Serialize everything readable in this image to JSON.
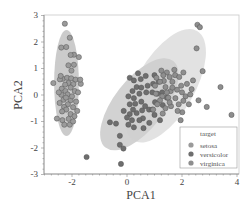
{
  "chart_data": {
    "type": "scatter",
    "title": "",
    "xlabel": "PCA1",
    "ylabel": "PCA2",
    "xlim": [
      -3.05,
      4.05
    ],
    "ylim": [
      -3,
      3
    ],
    "xticks": [
      -2,
      0,
      2,
      4
    ],
    "yticks": [
      -3,
      -2,
      -1,
      0,
      1,
      2,
      3
    ],
    "grid": false,
    "legend": {
      "title": "target",
      "position": "lower right",
      "entries": [
        "setosa",
        "versicolor",
        "virginica"
      ]
    },
    "ellipses": [
      {
        "name": "setosa",
        "cx": -2.2,
        "cy": 0.45,
        "rx": 0.45,
        "ry": 2.0,
        "angle_deg": 0,
        "fill": "#a8a8a8"
      },
      {
        "name": "versicolor",
        "cx": 0.45,
        "cy": -0.35,
        "rx": 2.0,
        "ry": 0.95,
        "angle_deg": 52,
        "fill": "#b4b4b4"
      },
      {
        "name": "virginica",
        "cx": 1.4,
        "cy": 0.35,
        "rx": 2.3,
        "ry": 1.1,
        "angle_deg": 60,
        "fill": "#cfcfcf"
      }
    ],
    "series": [
      {
        "name": "setosa",
        "color": "#9a9a9a",
        "points": [
          [
            -2.26,
            2.69
          ],
          [
            -2.39,
            1.79
          ],
          [
            -2.08,
            2.16
          ],
          [
            -2.21,
            1.81
          ],
          [
            -1.93,
            1.52
          ],
          [
            -2.05,
            1.51
          ],
          [
            -1.75,
            1.43
          ],
          [
            -1.93,
            1.14
          ],
          [
            -2.13,
            1.12
          ],
          [
            -2.02,
            0.92
          ],
          [
            -2.68,
            0.45
          ],
          [
            -2.33,
            0.61
          ],
          [
            -2.18,
            0.65
          ],
          [
            -2.44,
            0.59
          ],
          [
            -2.03,
            0.63
          ],
          [
            -1.87,
            0.58
          ],
          [
            -2.13,
            0.45
          ],
          [
            -2.25,
            0.39
          ],
          [
            -1.95,
            0.41
          ],
          [
            -1.68,
            0.42
          ],
          [
            -2.37,
            0.24
          ],
          [
            -2.05,
            0.28
          ],
          [
            -2.24,
            0.15
          ],
          [
            -1.9,
            0.15
          ],
          [
            -2.16,
            0.02
          ],
          [
            -2.39,
            0.01
          ],
          [
            -1.78,
            0.1
          ],
          [
            -2.31,
            -0.18
          ],
          [
            -2.05,
            -0.2
          ],
          [
            -1.85,
            -0.25
          ],
          [
            -2.15,
            -0.35
          ],
          [
            -2.45,
            -0.3
          ],
          [
            -2.29,
            -0.45
          ],
          [
            -1.96,
            -0.46
          ],
          [
            -2.21,
            -0.55
          ],
          [
            -1.81,
            -0.6
          ],
          [
            -2.36,
            -0.62
          ],
          [
            -2.05,
            -0.72
          ],
          [
            -1.91,
            -0.8
          ],
          [
            -2.12,
            -0.9
          ],
          [
            -2.35,
            -0.95
          ],
          [
            -2.55,
            -0.89
          ],
          [
            -2.28,
            -1.12
          ],
          [
            -2.08,
            -1.12
          ],
          [
            -1.96,
            -1.0
          ],
          [
            -2.22,
            -0.1
          ],
          [
            -2.0,
            -0.05
          ],
          [
            -2.48,
            0.1
          ],
          [
            -1.7,
            0.58
          ],
          [
            -2.41,
            0.72
          ]
        ]
      },
      {
        "name": "versicolor",
        "color": "#6e6e6e",
        "points": [
          [
            -1.47,
            -2.34
          ],
          [
            -0.62,
            -1.03
          ],
          [
            -0.26,
            -1.54
          ],
          [
            -0.26,
            -1.88
          ],
          [
            -0.13,
            -2.02
          ],
          [
            -0.22,
            -2.6
          ],
          [
            0.05,
            -1.12
          ],
          [
            0.25,
            -1.22
          ],
          [
            0.18,
            -0.95
          ],
          [
            -0.4,
            -1.08
          ],
          [
            0.1,
            -0.72
          ],
          [
            0.35,
            -0.68
          ],
          [
            0.58,
            -0.88
          ],
          [
            0.55,
            -0.58
          ],
          [
            0.8,
            -0.55
          ],
          [
            0.1,
            -0.35
          ],
          [
            0.3,
            -0.33
          ],
          [
            0.52,
            -0.25
          ],
          [
            0.05,
            -0.05
          ],
          [
            0.25,
            -0.12
          ],
          [
            0.45,
            0.05
          ],
          [
            0.7,
            0.1
          ],
          [
            0.92,
            0.1
          ],
          [
            1.1,
            0.05
          ],
          [
            1.28,
            0.1
          ],
          [
            0.2,
            0.15
          ],
          [
            0.35,
            0.3
          ],
          [
            0.52,
            0.28
          ],
          [
            0.75,
            0.35
          ],
          [
            0.95,
            0.42
          ],
          [
            1.15,
            0.5
          ],
          [
            0.25,
            0.55
          ],
          [
            0.5,
            0.6
          ],
          [
            0.68,
            0.72
          ],
          [
            0.4,
            0.82
          ],
          [
            0.1,
            0.65
          ],
          [
            1.0,
            0.75
          ],
          [
            0.22,
            -0.55
          ],
          [
            0.66,
            -0.42
          ],
          [
            1.02,
            -0.27
          ],
          [
            1.3,
            -0.38
          ],
          [
            1.0,
            -0.75
          ],
          [
            0.81,
            -1.05
          ],
          [
            1.2,
            -0.95
          ],
          [
            0.6,
            -1.25
          ],
          [
            0.0,
            -0.85
          ],
          [
            -0.12,
            -0.6
          ],
          [
            0.45,
            -0.95
          ],
          [
            0.92,
            -0.55
          ],
          [
            1.45,
            -0.1
          ]
        ]
      },
      {
        "name": "virginica",
        "color": "#8e8e8e",
        "points": [
          [
            2.56,
            2.65
          ],
          [
            2.65,
            2.56
          ],
          [
            2.53,
            1.76
          ],
          [
            1.07,
            0.65
          ],
          [
            1.34,
            0.53
          ],
          [
            1.55,
            0.68
          ],
          [
            1.75,
            0.75
          ],
          [
            1.9,
            0.68
          ],
          [
            1.65,
            0.5
          ],
          [
            1.4,
            0.3
          ],
          [
            1.59,
            0.15
          ],
          [
            1.82,
            0.2
          ],
          [
            2.0,
            0.1
          ],
          [
            1.28,
            -0.05
          ],
          [
            1.5,
            -0.1
          ],
          [
            1.76,
            -0.12
          ],
          [
            2.13,
            -0.05
          ],
          [
            2.25,
            -0.35
          ],
          [
            2.01,
            -0.65
          ],
          [
            1.84,
            -0.6
          ],
          [
            3.4,
            0.3
          ],
          [
            2.6,
            -0.2
          ],
          [
            2.9,
            -0.45
          ],
          [
            3.8,
            -0.75
          ],
          [
            1.2,
            -0.2
          ],
          [
            1.02,
            0.35
          ],
          [
            1.05,
            0.05
          ],
          [
            1.4,
            -0.5
          ],
          [
            1.6,
            -0.42
          ],
          [
            1.88,
            -0.35
          ],
          [
            2.18,
            0.42
          ],
          [
            2.4,
            0.55
          ],
          [
            1.3,
            -0.7
          ],
          [
            1.1,
            -0.35
          ],
          [
            1.45,
            0.85
          ],
          [
            1.72,
            0.95
          ],
          [
            2.05,
            0.85
          ],
          [
            2.35,
            0.22
          ],
          [
            2.05,
            -0.22
          ],
          [
            1.32,
            0.75
          ],
          [
            1.55,
            -0.28
          ],
          [
            1.97,
            0.35
          ],
          [
            2.3,
            0.02
          ],
          [
            1.65,
            0.28
          ],
          [
            1.2,
            0.5
          ],
          [
            1.25,
            0.92
          ],
          [
            2.75,
            0.9
          ],
          [
            1.95,
            -0.95
          ],
          [
            0.95,
            -0.55
          ],
          [
            1.45,
            0.1
          ]
        ]
      }
    ]
  },
  "axes": {
    "x_label": "PCA1",
    "y_label": "PCA2",
    "x_ticks": [
      "-2",
      "0",
      "2",
      "4"
    ],
    "y_ticks": [
      "3",
      "2",
      "1",
      "0",
      "-1",
      "-2",
      "-3"
    ]
  },
  "legend": {
    "title": "target",
    "items": [
      {
        "label": "setosa",
        "color": "#9a9a9a"
      },
      {
        "label": "versicolor",
        "color": "#6e6e6e"
      },
      {
        "label": "virginica",
        "color": "#8e8e8e"
      }
    ]
  }
}
